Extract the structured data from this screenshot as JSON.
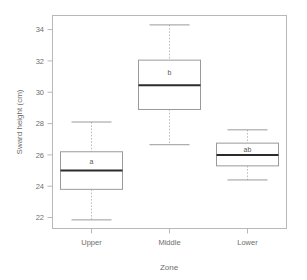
{
  "chart_data": {
    "type": "box",
    "title": "",
    "xlabel": "Zone",
    "ylabel": "Sward height (cm)",
    "categories": [
      "Upper",
      "Middle",
      "Lower"
    ],
    "ylim": [
      21.3,
      34.9
    ],
    "yticks": [
      22,
      24,
      26,
      28,
      30,
      32,
      34
    ],
    "ytick_labels": [
      "22",
      "24",
      "26",
      "28",
      "30",
      "32",
      "34"
    ],
    "grid": false,
    "legend": "none",
    "annotations": [
      "a",
      "b",
      "ab"
    ],
    "boxes": [
      {
        "category": "Upper",
        "letter": "a",
        "lower_whisker": 21.85,
        "q1": 23.8,
        "median": 25.0,
        "q3": 26.2,
        "upper_whisker": 28.1
      },
      {
        "category": "Middle",
        "letter": "b",
        "lower_whisker": 26.65,
        "q1": 28.9,
        "median": 30.45,
        "q3": 32.05,
        "upper_whisker": 34.3
      },
      {
        "category": "Lower",
        "letter": "ab",
        "lower_whisker": 24.4,
        "q1": 25.3,
        "median": 26.0,
        "q3": 26.75,
        "upper_whisker": 27.6
      }
    ],
    "colors": {
      "frame": "#b8b8b8",
      "box_outline": "#9a9a9a",
      "median": "#2b2b2b",
      "whisker": "#bdbdbd",
      "text": "#6e6e6e",
      "background": "#ffffff"
    }
  }
}
